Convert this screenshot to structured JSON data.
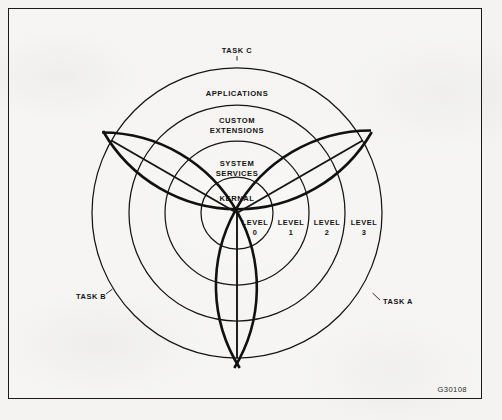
{
  "figure": {
    "id_label": "G30108",
    "background_color": "#f4f3f1",
    "ink_color": "#151515",
    "frame": {
      "x": 8,
      "y": 8,
      "width": 474,
      "height": 391
    }
  },
  "diagram": {
    "type": "concentric-rings",
    "center": {
      "x": 237,
      "y": 213
    },
    "ring_radii": [
      36,
      72,
      108,
      145
    ],
    "outer_arc_radius": 155,
    "sector_count": 3,
    "sector_boundary_angles_deg": [
      30,
      150,
      270
    ],
    "rings": [
      {
        "name": "kernal",
        "label": "KERNAL",
        "level": "0",
        "outer_radius": 36,
        "label_x": 237,
        "label_y": 199
      },
      {
        "name": "system-services",
        "label_line1": "SYSTEM",
        "label_line2": "SERVICES",
        "level": "1",
        "outer_radius": 72,
        "label_x": 237,
        "label_y": 166
      },
      {
        "name": "custom-extensions",
        "label_line1": "CUSTOM",
        "label_line2": "EXTENSIONS",
        "level": "2",
        "outer_radius": 108,
        "label_x": 237,
        "label_y": 123
      },
      {
        "name": "applications",
        "label_line1": "APPLICATIONS",
        "label_line2": "",
        "level": "3",
        "outer_radius": 145,
        "label_x": 237,
        "label_y": 94
      }
    ],
    "level_markers": [
      {
        "name": "level-0",
        "line1": "LEVEL",
        "line2": "0",
        "x": 255,
        "y": 225
      },
      {
        "name": "level-1",
        "line1": "LEVEL",
        "line2": "1",
        "x": 291,
        "y": 225
      },
      {
        "name": "level-2",
        "line1": "LEVEL",
        "line2": "2",
        "x": 327,
        "y": 225
      },
      {
        "name": "level-3",
        "line1": "LEVEL",
        "line2": "3",
        "x": 364,
        "y": 225
      }
    ],
    "tasks": [
      {
        "name": "task-c",
        "label": "TASK C",
        "x": 237,
        "y": 52,
        "anchor": "middle",
        "angle_deg": 90
      },
      {
        "name": "task-a",
        "label": "TASK A",
        "x": 383,
        "y": 303,
        "anchor": "start",
        "angle_deg": 330
      },
      {
        "name": "task-b",
        "label": "TASK B",
        "x": 78,
        "y": 298,
        "anchor": "start",
        "angle_deg": 210
      }
    ]
  }
}
